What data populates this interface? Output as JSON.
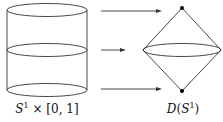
{
  "diagram": {
    "cylinder_label": {
      "S": "S",
      "sup": "1",
      "rest": " × [0, 1]"
    },
    "disk_label": {
      "D": "D",
      "open": "(",
      "S": "S",
      "sup": "1",
      "close": ")"
    },
    "arrows": [
      {
        "name": "top-arrow",
        "from": "cylinder-top",
        "to": "cone-top-apex"
      },
      {
        "name": "middle-arrow",
        "from": "cylinder-middle",
        "to": "cone-equator"
      },
      {
        "name": "bottom-arrow",
        "from": "cylinder-bottom",
        "to": "cone-bottom-apex"
      }
    ],
    "colors": {
      "stroke": "#333333",
      "dot": "#000000"
    }
  }
}
